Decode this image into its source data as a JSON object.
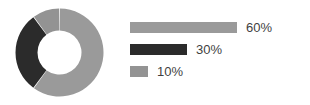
{
  "chart_data": {
    "type": "pie",
    "variant": "donut",
    "title": "",
    "subtitle": "",
    "xlabel": "",
    "ylabel": "",
    "grid": false,
    "legend_position": "right",
    "legend_style": "proportional-bars",
    "units": "percent",
    "total": 100,
    "start_angle_deg": 0,
    "direction": "clockwise",
    "inner_radius_ratio": 0.5,
    "categories": [
      "60%",
      "30%",
      "10%"
    ],
    "values": [
      60,
      30,
      10
    ],
    "colors": [
      "#9a9a9a",
      "#2b2b2b",
      "#939393"
    ],
    "slices": [
      {
        "label": "60%",
        "value": 60,
        "color": "#9a9a9a",
        "bar_length_px": 107
      },
      {
        "label": "30%",
        "value": 30,
        "color": "#2b2b2b",
        "bar_length_px": 57
      },
      {
        "label": "10%",
        "value": 10,
        "color": "#939393",
        "bar_length_px": 18
      }
    ]
  },
  "legend": {
    "items": [
      {
        "label": "60%"
      },
      {
        "label": "30%"
      },
      {
        "label": "10%"
      }
    ]
  },
  "style": {
    "background": "#ffffff",
    "text_color": "#3f3f3f",
    "separator_color": "#ffffff"
  }
}
